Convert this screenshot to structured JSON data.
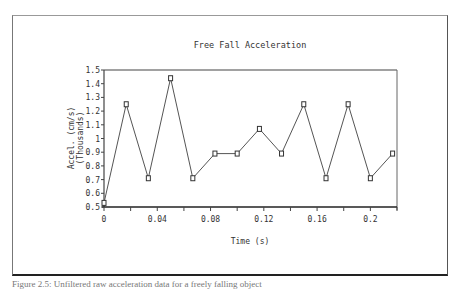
{
  "chart_data": {
    "type": "line",
    "title": "Free Fall Acceleration",
    "xlabel": "Time (s)",
    "ylabel": "Accel. (cm/s)",
    "ylabel_sub": "(Thousands)",
    "xlim": [
      0,
      0.22
    ],
    "ylim": [
      0.5,
      1.5
    ],
    "x_ticks": [
      0,
      0.02,
      0.04,
      0.06,
      0.08,
      0.1,
      0.12,
      0.14,
      0.16,
      0.18,
      0.2,
      0.22
    ],
    "x_tick_labels": [
      "0",
      "",
      "0.04",
      "",
      "0.08",
      "",
      "0.12",
      "",
      "0.16",
      "",
      "0.2",
      ""
    ],
    "y_ticks": [
      0.5,
      0.6,
      0.7,
      0.8,
      0.9,
      1.0,
      1.1,
      1.2,
      1.3,
      1.4,
      1.5
    ],
    "y_tick_labels": [
      "0.5",
      "0.6",
      "0.7",
      "0.8",
      "0.9",
      "1",
      "1.1",
      "1.2",
      "1.3",
      "1.4",
      "1.5"
    ],
    "grid": false,
    "legend": null,
    "series": [
      {
        "name": "Acceleration",
        "marker": "square",
        "x": [
          0,
          0.0167,
          0.0333,
          0.05,
          0.0667,
          0.0833,
          0.1,
          0.1167,
          0.1333,
          0.15,
          0.1667,
          0.1833,
          0.2,
          0.2167
        ],
        "values": [
          0.53,
          1.25,
          0.71,
          1.44,
          0.71,
          0.89,
          0.89,
          1.07,
          0.89,
          1.25,
          0.71,
          1.25,
          0.71,
          0.89
        ]
      }
    ]
  },
  "caption": "Figure 2.5: Unfiltered raw acceleration data for a freely falling object"
}
